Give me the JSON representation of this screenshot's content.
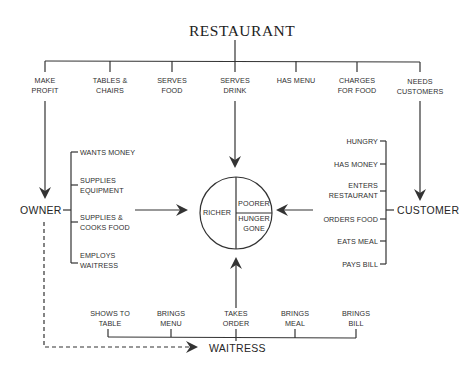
{
  "title": "RESTAURANT",
  "restaurant_attributes": [
    {
      "label": "MAKE\nPROFIT"
    },
    {
      "label": "TABLES &\nCHAIRS"
    },
    {
      "label": "SERVES\nFOOD"
    },
    {
      "label": "SERVES\nDRINK"
    },
    {
      "label": "HAS MENU"
    },
    {
      "label": "CHARGES\nFOR FOOD"
    },
    {
      "label": "NEEDS\nCUSTOMERS"
    }
  ],
  "owner": {
    "label": "OWNER",
    "attributes": [
      {
        "label": "WANTS MONEY"
      },
      {
        "label": "SUPPLIES\nEQUIPMENT"
      },
      {
        "label": "SUPPLIES &\nCOOKS FOOD"
      },
      {
        "label": "EMPLOYS\nWAITRESS"
      }
    ]
  },
  "customer": {
    "label": "CUSTOMER",
    "attributes": [
      {
        "label": "HUNGRY"
      },
      {
        "label": "HAS MONEY"
      },
      {
        "label": "ENTERS\nRESTAURANT"
      },
      {
        "label": "ORDERS FOOD"
      },
      {
        "label": "EATS MEAL"
      },
      {
        "label": "PAYS BILL"
      }
    ]
  },
  "waitress": {
    "label": "WAITRESS",
    "attributes": [
      {
        "label": "SHOWS TO\nTABLE"
      },
      {
        "label": "BRINGS\nMENU"
      },
      {
        "label": "TAKES\nORDER"
      },
      {
        "label": "BRINGS\nMEAL"
      },
      {
        "label": "BRINGS\nBILL"
      }
    ]
  },
  "outcome_circle": {
    "left": "RICHER",
    "top_right": "POORER",
    "bottom_right": "HUNGER\nGONE"
  },
  "colors": {
    "line": "#333333",
    "text": "#2a2a2a",
    "background": "#ffffff"
  }
}
